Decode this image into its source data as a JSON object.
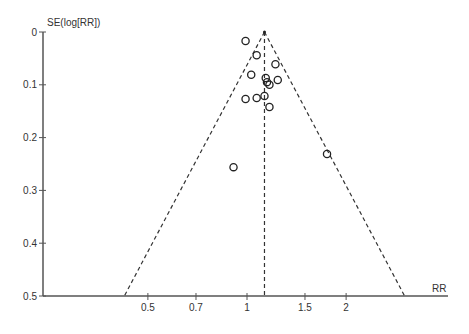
{
  "chart_data": {
    "type": "scatter",
    "title": "",
    "subtype": "funnel plot",
    "xlabel": "RR",
    "ylabel": "SE(log[RR])",
    "x_scale": "log",
    "y_reversed": true,
    "xticks": [
      0.5,
      0.7,
      1,
      1.5,
      2
    ],
    "xtick_labels": [
      "0.5",
      "0.7",
      "1",
      "1.5",
      "2"
    ],
    "yticks": [
      0,
      0.1,
      0.2,
      0.3,
      0.4,
      0.5
    ],
    "ytick_labels": [
      "0",
      "0.1",
      "0.2",
      "0.3",
      "0.4",
      "0.5"
    ],
    "ylim": [
      0,
      0.5
    ],
    "pooled_rr": 1.13,
    "confidence_limits": "pseudo 95% CI (dashed funnel)",
    "points": [
      {
        "rr": 0.99,
        "se": 0.017
      },
      {
        "rr": 1.07,
        "se": 0.044
      },
      {
        "rr": 1.22,
        "se": 0.061
      },
      {
        "rr": 1.03,
        "se": 0.081
      },
      {
        "rr": 1.24,
        "se": 0.091
      },
      {
        "rr": 1.14,
        "se": 0.087
      },
      {
        "rr": 1.15,
        "se": 0.095
      },
      {
        "rr": 1.17,
        "se": 0.1
      },
      {
        "rr": 1.13,
        "se": 0.121
      },
      {
        "rr": 1.07,
        "se": 0.125
      },
      {
        "rr": 0.99,
        "se": 0.127
      },
      {
        "rr": 1.17,
        "se": 0.142
      },
      {
        "rr": 1.75,
        "se": 0.231
      },
      {
        "rr": 0.91,
        "se": 0.256
      }
    ],
    "grid": false,
    "legend": null
  }
}
